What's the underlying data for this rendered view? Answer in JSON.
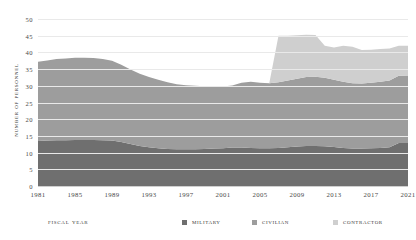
{
  "chart_data": {
    "type": "area",
    "stacked": true,
    "title": "",
    "xlabel": "Fiscal Year",
    "ylabel": "Number of Personnel",
    "xlim": [
      1981,
      2021
    ],
    "ylim": [
      0,
      50
    ],
    "ytick_labels": [
      "0",
      "5",
      "10",
      "15",
      "20",
      "25",
      "30",
      "35",
      "40",
      "45",
      "50"
    ],
    "ytick_values": [
      0,
      5,
      10,
      15,
      20,
      25,
      30,
      35,
      40,
      45,
      50
    ],
    "xtick_labels": [
      "1981",
      "1985",
      "1989",
      "1993",
      "1997",
      "2001",
      "2005",
      "2009",
      "2013",
      "2017",
      "2021"
    ],
    "xtick_values": [
      1981,
      1985,
      1989,
      1993,
      1997,
      2001,
      2005,
      2009,
      2013,
      2017,
      2021
    ],
    "grid": true,
    "legend_position": "bottom",
    "x": [
      1981,
      1982,
      1983,
      1984,
      1985,
      1986,
      1987,
      1988,
      1989,
      1990,
      1991,
      1992,
      1993,
      1994,
      1995,
      1996,
      1997,
      1998,
      1999,
      2000,
      2001,
      2002,
      2003,
      2004,
      2005,
      2006,
      2007,
      2008,
      2009,
      2010,
      2011,
      2012,
      2013,
      2014,
      2015,
      2016,
      2017,
      2018,
      2019,
      2020,
      2021
    ],
    "series": [
      {
        "name": "Military",
        "color": "#6f6f6f",
        "values": [
          13.5,
          13.6,
          13.7,
          13.7,
          13.8,
          13.8,
          13.8,
          13.7,
          13.6,
          13.2,
          12.6,
          12.0,
          11.6,
          11.3,
          11.1,
          11.0,
          11.0,
          11.0,
          11.1,
          11.2,
          11.3,
          11.5,
          11.5,
          11.4,
          11.3,
          11.3,
          11.4,
          11.6,
          11.8,
          12.0,
          12.0,
          11.9,
          11.7,
          11.4,
          11.2,
          11.2,
          11.3,
          11.4,
          11.6,
          12.9,
          12.9
        ]
      },
      {
        "name": "Civilian",
        "color": "#9d9d9d",
        "values": [
          23.7,
          24.0,
          24.3,
          24.5,
          24.6,
          24.6,
          24.5,
          24.3,
          23.9,
          23.1,
          22.3,
          21.6,
          21.0,
          20.5,
          20.0,
          19.5,
          19.2,
          19.0,
          18.8,
          18.6,
          18.5,
          18.6,
          19.4,
          19.8,
          19.6,
          19.5,
          19.7,
          20.0,
          20.3,
          20.6,
          20.7,
          20.5,
          20.1,
          19.8,
          19.6,
          19.5,
          19.6,
          19.8,
          20.0,
          20.1,
          20.2
        ]
      },
      {
        "name": "Contractor",
        "color": "#cfcfcf",
        "values": [
          0,
          0,
          0,
          0,
          0,
          0,
          0,
          0,
          0,
          0,
          0,
          0,
          0,
          0,
          0,
          0,
          0,
          0,
          0,
          0,
          0,
          0,
          0,
          0,
          0,
          0,
          13.9,
          13.4,
          13.0,
          12.7,
          12.5,
          9.6,
          9.7,
          10.8,
          10.9,
          10.0,
          9.9,
          9.8,
          9.6,
          9.0,
          8.9
        ]
      }
    ]
  },
  "legend": {
    "axis_title": "Fiscal Year",
    "items": [
      {
        "label": "Military",
        "color": "#6f6f6f"
      },
      {
        "label": "Civilian",
        "color": "#9d9d9d"
      },
      {
        "label": "Contractor",
        "color": "#cfcfcf"
      }
    ]
  }
}
